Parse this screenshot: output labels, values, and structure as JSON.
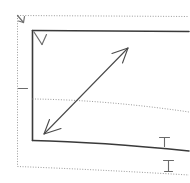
{
  "canvas": {
    "width": 190,
    "height": 183,
    "background_color": "#ffffff",
    "title": "Hand-drawn geometric sketch"
  },
  "palette": {
    "solid_line_color": "#3a3a3a",
    "thin_line_color": "#4a4a4a",
    "dotted_line_color": "#9a9a9a",
    "tick_color": "#6a6a6a",
    "arrow_color": "#6f6f6f"
  },
  "shapes": {
    "outer_dotted_frame": {
      "name": "outer-dotted-frame",
      "style": "dotted",
      "left_x": 17,
      "top_y": 15,
      "right_x": 189,
      "bottom_left_y": 166,
      "bottom_right_y": 175,
      "note": "open on right side, bottom edge slopes down to the right"
    },
    "inner_solid_box": {
      "name": "inner-solid-box",
      "style": "solid",
      "left_x": 32,
      "top_y": 30,
      "right_x": 189,
      "bottom_left_y": 140,
      "bottom_right_y": 150,
      "note": "open on right side, bottom edge slopes down to the right"
    },
    "middle_dotted_curve": {
      "name": "middle-dotted-curve",
      "style": "dotted",
      "start_x": 32,
      "start_y": 99,
      "end_x": 189,
      "end_y": 112,
      "note": "gentle downward curve to the right"
    },
    "diagonal_double_arrow": {
      "name": "diagonal-double-arrow",
      "style": "solid-thin",
      "tail_x": 44,
      "tail_y": 134,
      "head_x": 128,
      "head_y": 48,
      "heads": "both",
      "note": "double headed arrow crossing the dotted curve"
    },
    "corner_chevron": {
      "name": "corner-chevron-mark",
      "x": 34,
      "y": 32,
      "note": "small V / arrowhead glyph at inner box top-left corner"
    },
    "frame_corner_arrow": {
      "name": "frame-corner-arrow-mark",
      "x": 18,
      "y": 16,
      "note": "small arrowhead glyph at outer dotted frame top-left corner"
    }
  },
  "ticks": [
    {
      "name": "left-axis-tick",
      "label": "",
      "x": 22,
      "y": 88,
      "orientation": "horizontal",
      "length": 8,
      "attached_to": "outer-dotted-frame-left-edge"
    },
    {
      "name": "bottom-solid-tick",
      "label": "",
      "x": 164,
      "y": 146,
      "orientation": "t-bar-up",
      "length": 10,
      "attached_to": "inner-solid-box-bottom-edge"
    },
    {
      "name": "bottom-dotted-tick",
      "label": "",
      "x": 168,
      "y": 171,
      "orientation": "i-beam-up",
      "length": 11,
      "attached_to": "outer-dotted-frame-bottom-edge"
    }
  ],
  "labels": {
    "caption": ""
  }
}
